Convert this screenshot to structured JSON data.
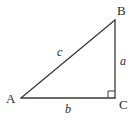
{
  "figure": {
    "kind": "right-triangle-diagram",
    "background_color": "#ffffff",
    "stroke_color": "#3a3a3a",
    "text_color": "#2b2b2b",
    "vertices": [
      {
        "id": "A",
        "label": "A",
        "x": 21,
        "y": 98
      },
      {
        "id": "B",
        "label": "B",
        "x": 115,
        "y": 20
      },
      {
        "id": "C",
        "label": "C",
        "x": 115,
        "y": 98
      }
    ],
    "sides": [
      {
        "id": "a",
        "label": "a",
        "from": "B",
        "to": "C",
        "role": "opposite-leg-vertical"
      },
      {
        "id": "b",
        "label": "b",
        "from": "A",
        "to": "C",
        "role": "adjacent-leg-horizontal"
      },
      {
        "id": "c",
        "label": "c",
        "from": "A",
        "to": "B",
        "role": "hypotenuse"
      }
    ],
    "right_angle": {
      "at_vertex": "C",
      "marker": "square",
      "size": 7
    }
  },
  "geometry": {
    "path_points": "21,98 115,20 115,98 21,98",
    "hypotenuse": "21,98 115,20",
    "vertical_leg": "115,20 115,98",
    "horizontal_leg": "21,98 115,98",
    "right_angle_marker": "108,98 108,91 115,91"
  }
}
